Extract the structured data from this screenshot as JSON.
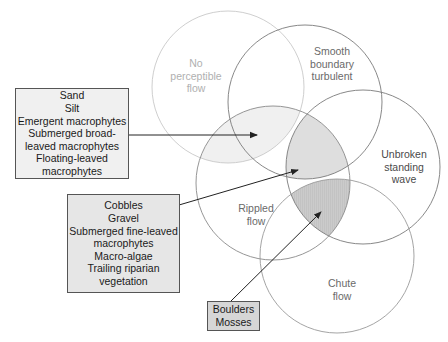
{
  "colors": {
    "circle_faded": "#c8c8c8",
    "circle": "#7a7a7a",
    "region_light": "#f0f0f0",
    "region_medium": "#dedede",
    "region_dark": "#cbcbcb",
    "box1_fill": "#f0f0f0",
    "box2_fill": "#e6e6e6",
    "box3_fill": "#d6d6d6",
    "arrow": "#222222"
  },
  "circles": [
    {
      "id": "no-perceptible-flow",
      "label": "No\nperceptible\nflow",
      "cx": 228,
      "cy": 87,
      "r": 76
    },
    {
      "id": "smooth-boundary-turbulent",
      "label": "Smooth\nboundary\nturbulent",
      "cx": 305,
      "cy": 102,
      "r": 77
    },
    {
      "id": "unbroken-standing-wave",
      "label": "Unbroken\nstanding\nwave",
      "cx": 363,
      "cy": 167,
      "r": 77
    },
    {
      "id": "rippled-flow",
      "label": "Rippled\nflow",
      "cx": 273,
      "cy": 183,
      "r": 77
    },
    {
      "id": "chute-flow",
      "label": "Chute\nflow",
      "cx": 337,
      "cy": 256,
      "r": 77
    }
  ],
  "boxes": [
    {
      "id": "box-sand-silt",
      "lines": "Sand\nSilt\nEmergent macrophytes\nSubmerged broad-\nleaved macrophytes\nFloating-leaved\nmacrophytes"
    },
    {
      "id": "box-cobbles-gravel",
      "lines": "Cobbles\nGravel\nSubmerged fine-leaved\nmacrophytes\nMacro-algae\nTrailing riparian\nvegetation"
    },
    {
      "id": "box-boulders-mosses",
      "lines": "Boulders\nMosses"
    }
  ],
  "arrows": [
    {
      "from": [
        128,
        135
      ],
      "to": [
        257,
        135
      ]
    },
    {
      "from": [
        179,
        205
      ],
      "to": [
        298,
        170
      ]
    },
    {
      "from": [
        231,
        301
      ],
      "to": [
        321,
        212
      ]
    }
  ]
}
